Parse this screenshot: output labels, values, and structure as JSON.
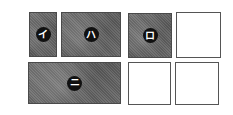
{
  "diagram": {
    "boxes": [
      {
        "id": "i",
        "label": "イ",
        "fill": "shaded",
        "x": 29,
        "y": 12,
        "w": 28,
        "h": 45
      },
      {
        "id": "ha",
        "label": "ハ",
        "fill": "shaded",
        "x": 61,
        "y": 12,
        "w": 60,
        "h": 45
      },
      {
        "id": "ro",
        "label": "ロ",
        "fill": "shaded",
        "x": 128,
        "y": 13,
        "w": 44,
        "h": 45
      },
      {
        "id": "blank-top-right",
        "label": "",
        "fill": "empty",
        "x": 176,
        "y": 12,
        "w": 45,
        "h": 46
      },
      {
        "id": "ni",
        "label": "ニ",
        "fill": "shaded",
        "x": 28,
        "y": 62,
        "w": 93,
        "h": 42
      },
      {
        "id": "blank-bottom-middle",
        "label": "",
        "fill": "empty",
        "x": 128,
        "y": 62,
        "w": 43,
        "h": 43
      },
      {
        "id": "blank-bottom-right",
        "label": "",
        "fill": "empty",
        "x": 175,
        "y": 62,
        "w": 44,
        "h": 43
      }
    ],
    "colors": {
      "shaded": "#6a6a6a",
      "badge": "#111111",
      "border": "#4a4a4a"
    }
  }
}
